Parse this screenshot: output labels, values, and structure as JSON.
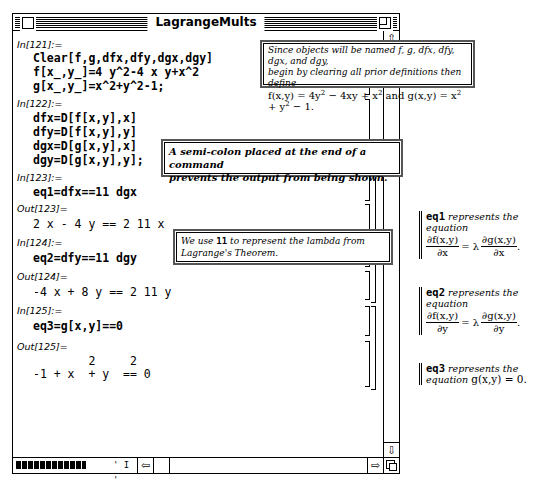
{
  "window": {
    "title": "LagrangeMults"
  },
  "cells": [
    {
      "label": "In[121]:=",
      "lines": [
        "Clear[f,g,dfx,dfy,dgx,dgy]",
        "f[x_,y_]=4 y^2-4 x y+x^2",
        "g[x_,y_]=x^2+y^2-1;"
      ]
    },
    {
      "label": "In[122]:=",
      "lines": [
        "dfx=D[f[x,y],x]",
        "dfy=D[f[x,y],y]",
        "dgx=D[g[x,y],x]",
        "dgy=D[g[x,y],y];"
      ]
    },
    {
      "label": "In[123]:=",
      "lines": [
        "eq1=dfx==11 dgx"
      ]
    },
    {
      "label": "Out[123]=",
      "lines": [
        "2 x - 4 y == 2 11 x"
      ]
    },
    {
      "label": "In[124]:=",
      "lines": [
        "eq2=dfy==11 dgy"
      ]
    },
    {
      "label": "Out[124]=",
      "lines": [
        "-4 x + 8 y == 2 11 y"
      ]
    },
    {
      "label": "In[125]:=",
      "lines": [
        "eq3=g[x,y]==0"
      ]
    },
    {
      "label": "Out[125]=",
      "lines": [
        "        2     2",
        "-1 + x  + y  == 0"
      ]
    }
  ],
  "callouts": {
    "clear": {
      "line1": "Since objects will be named f, g, dfx, dfy, dgx, and dgy,",
      "line2": "begin by clearing all prior definitions then define",
      "f_def": "f(x,y) = 4y",
      "f_def2": " − 4xy + x",
      "and": " and ",
      "g_def": "g(x,y) = x",
      "g_def2": " + y",
      "g_def3": " − 1."
    },
    "semicolon": {
      "line1": "A semi-colon placed at the end of a command",
      "line2": "prevents the output from being shown."
    },
    "lambda": {
      "pre": "We use ",
      "code": "11",
      "post": " to represent the lambda from",
      "line2": "Lagrange's Theorem."
    }
  },
  "notes": [
    {
      "name": "eq1",
      "text": " represents the",
      "text2": "equation",
      "num1": "∂f(x,y)",
      "den1": "∂x",
      "eq": "= λ",
      "num2": "∂g(x,y)",
      "den2": "∂x",
      "end": "."
    },
    {
      "name": "eq2",
      "text": " represents the",
      "text2": "equation",
      "num1": "∂f(x,y)",
      "den1": "∂y",
      "eq": "= λ",
      "num2": "∂g(x,y)",
      "den2": "∂y",
      "end": "."
    },
    {
      "name": "eq3",
      "text": " represents the",
      "text2": "equation ",
      "formula": "g(x,y) = 0."
    }
  ],
  "scrollbars": {
    "up": "⇧",
    "down": "⇩",
    "left": "⇦",
    "right": "⇨",
    "magnify_ticks": "' I '"
  },
  "superscripts": {
    "two": "2"
  }
}
